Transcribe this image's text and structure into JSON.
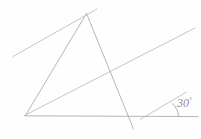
{
  "figure": {
    "background_color": "#fefefe",
    "stroke_color": "#a9a9ad",
    "width": 201,
    "height": 139
  },
  "annotations": {
    "angle_value": "30",
    "angle_unit": "°",
    "angle_full_label": "30°"
  },
  "geometry": {
    "type": "line-diagram",
    "points": {
      "apex": [
        86,
        13
      ],
      "left_base": [
        25,
        115
      ],
      "right_base": [
        143,
        117
      ],
      "upper_left_end": [
        13,
        56
      ],
      "upper_right_end": [
        195,
        28
      ],
      "baseline_right_end": [
        198,
        116
      ],
      "right_side_lower_end": [
        133,
        129
      ],
      "transversal_upper_left_end": [
        40,
        89
      ]
    },
    "segments": [
      {
        "name": "triangle-left-side",
        "from": [
          86,
          13
        ],
        "to": [
          25,
          115
        ]
      },
      {
        "name": "triangle-right-side",
        "from": [
          86,
          13
        ],
        "to": [
          133,
          129
        ]
      },
      {
        "name": "baseline",
        "from": [
          25,
          116
        ],
        "to": [
          198,
          116
        ]
      },
      {
        "name": "transversal-through-apex",
        "from": [
          13,
          56
        ],
        "to": [
          97,
          9
        ]
      },
      {
        "name": "long-transversal",
        "from": [
          25,
          115
        ],
        "to": [
          195,
          28
        ]
      },
      {
        "name": "angle-ray",
        "from": [
          143,
          117
        ],
        "to": [
          186,
          92
        ]
      }
    ],
    "angle_arc": {
      "vertex": [
        163,
        117
      ],
      "radius": 17,
      "between": [
        "baseline",
        "angle-ray"
      ]
    }
  }
}
